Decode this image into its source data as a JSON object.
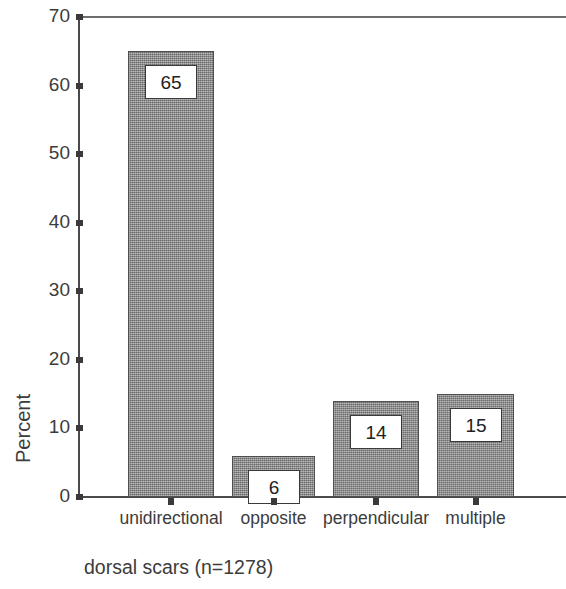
{
  "chart_data": {
    "type": "bar",
    "title": "",
    "subtitle": "",
    "caption": "dorsal scars (n=1278)",
    "categories": [
      "unidirectional",
      "opposite",
      "perpendicular",
      "multiple"
    ],
    "values": [
      65,
      6,
      14,
      15
    ],
    "data_labels": [
      "65",
      "6",
      "14",
      "15"
    ],
    "xlabel": "",
    "ylabel": "Percent",
    "ylim": [
      0,
      70
    ],
    "ytick_labels": [
      "0",
      "10",
      "20",
      "30",
      "40",
      "50",
      "60",
      "70"
    ],
    "ytick_values": [
      0,
      10,
      20,
      30,
      40,
      50,
      60,
      70
    ],
    "grid": false,
    "legend": null,
    "legend_position": "none",
    "colors": {
      "bar_fill": "#8e8e8e",
      "bar_edge": "#4f4f4f",
      "axis": "#4a4a4a",
      "text": "#3c3c3c",
      "label_box_fill": "#ffffff",
      "label_box_edge": "#3a3a3a",
      "background": "#ffffff"
    }
  }
}
